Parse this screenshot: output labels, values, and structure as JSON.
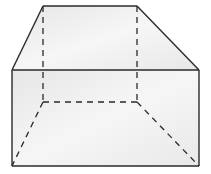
{
  "diagram": {
    "type": "3d-solid-wireframe",
    "shape": "prism-with-trapezoidal-top",
    "colors": {
      "background": "#ffffff",
      "face_fill": "#ececec",
      "face_fill_light": "#f7f7f7",
      "edge": "#2a2a2a"
    },
    "vertices": {
      "top_back_left": [
        43,
        6
      ],
      "top_back_right": [
        137,
        6
      ],
      "front_top_left": [
        12,
        70
      ],
      "front_top_right": [
        199,
        70
      ],
      "front_bottom_left": [
        12,
        166
      ],
      "front_bottom_right": [
        199,
        166
      ],
      "back_bottom_left": [
        43,
        102
      ],
      "back_bottom_right": [
        137,
        102
      ]
    },
    "edges": {
      "solid": [
        [
          "top_back_left",
          "top_back_right"
        ],
        [
          "top_back_left",
          "front_top_left"
        ],
        [
          "top_back_right",
          "front_top_right"
        ],
        [
          "front_top_left",
          "front_top_right"
        ],
        [
          "front_top_left",
          "front_bottom_left"
        ],
        [
          "front_top_right",
          "front_bottom_right"
        ],
        [
          "front_bottom_left",
          "front_bottom_right"
        ]
      ],
      "dashed": [
        [
          "top_back_left",
          "back_bottom_left"
        ],
        [
          "top_back_right",
          "back_bottom_right"
        ],
        [
          "back_bottom_left",
          "back_bottom_right"
        ],
        [
          "back_bottom_left",
          "front_bottom_left"
        ],
        [
          "back_bottom_right",
          "front_bottom_right"
        ]
      ]
    }
  }
}
